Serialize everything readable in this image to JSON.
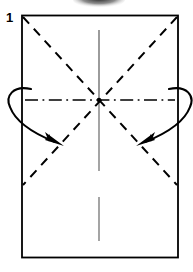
{
  "figure": {
    "step_label": "1",
    "caption": "Rectangular sheet with pre-creased diagonals, vertical centre line and horizontal centre line; two curved arrows fold the left and right edges inward to the centre."
  },
  "colors": {
    "ink": "#000000",
    "paper": "#ffffff",
    "faint_ink": "#555555",
    "smudge": "#1a1a1a"
  },
  "paper": {
    "name": "paper-rectangle",
    "x": 22,
    "y": 15.5,
    "width": 156,
    "height": 242,
    "stroke_width": 1.6,
    "line_style": "solid",
    "meaning": "paper edge"
  },
  "creases": [
    {
      "name": "diagonal-crease-tl-br",
      "kind": "valley",
      "line_style": "dashed",
      "from": [
        22,
        15.5
      ],
      "to": [
        178,
        185
      ],
      "stroke_width": 1.9,
      "dash": "9 7"
    },
    {
      "name": "diagonal-crease-tr-bl",
      "kind": "valley",
      "line_style": "dashed",
      "from": [
        178,
        15.5
      ],
      "to": [
        22,
        185
      ],
      "stroke_width": 1.9,
      "dash": "9 7"
    },
    {
      "name": "horizontal-centre-crease",
      "kind": "mountain",
      "line_style": "dash-dot",
      "from": [
        24,
        100
      ],
      "to": [
        176,
        100
      ],
      "stroke_width": 1.5,
      "dash": "12 4 1.6 4"
    },
    {
      "name": "vertical-centre-crease-upper",
      "kind": "existing-crease",
      "line_style": "solid-faint",
      "from": [
        99,
        30
      ],
      "to": [
        99,
        100
      ],
      "stroke_width": 1.0
    },
    {
      "name": "vertical-centre-crease-middle",
      "kind": "existing-crease",
      "line_style": "solid-faint",
      "from": [
        99,
        100
      ],
      "to": [
        99,
        170
      ],
      "stroke_width": 1.0
    },
    {
      "name": "vertical-centre-crease-lower",
      "kind": "existing-crease",
      "line_style": "solid-faint",
      "from": [
        99,
        196
      ],
      "to": [
        99,
        241
      ],
      "stroke_width": 1.0
    }
  ],
  "centre_point": {
    "name": "centre-convergence-point",
    "x": 99,
    "y": 100,
    "radius": 2.2
  },
  "arrows": [
    {
      "name": "fold-arrow-left",
      "direction": "inward-right-down",
      "path": "M 30 90 C 13 86, 6 96, 10 106 C 15 122, 35 134, 56 142",
      "head_at": [
        61,
        144
      ],
      "head_angle_deg": 24,
      "stroke_width": 2.0,
      "meaning": "fold left edge to centre"
    },
    {
      "name": "fold-arrow-right",
      "direction": "inward-left-down",
      "path": "M 170 90 C 187 86, 194 96, 190 106 C 185 122, 165 134, 144 142",
      "head_at": [
        139,
        144
      ],
      "head_angle_deg": 156,
      "stroke_width": 2.0,
      "meaning": "fold right edge to centre"
    }
  ],
  "artifacts": [
    {
      "name": "scan-smudge-top",
      "x": 76,
      "y": -6,
      "width": 46,
      "height": 13,
      "note": "dark scan artifact at top edge"
    }
  ]
}
